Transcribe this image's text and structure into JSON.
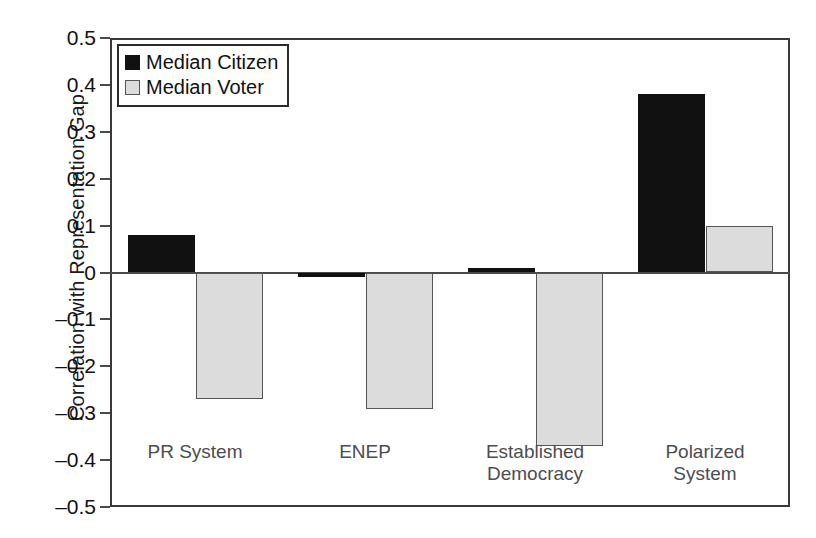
{
  "chart_data": {
    "type": "bar",
    "title": "",
    "xlabel": "",
    "ylabel": "Correlation with Representation Gap",
    "ylim": [
      -0.5,
      0.5
    ],
    "ytick_labels": [
      "0.5",
      "0.4",
      "0.3",
      "0.2",
      "0.1",
      "0",
      "–0.1",
      "–0.2",
      "–0.3",
      "–0.4",
      "–0.5"
    ],
    "ytick_values": [
      0.5,
      0.4,
      0.3,
      0.2,
      0.1,
      0,
      -0.1,
      -0.2,
      -0.3,
      -0.4,
      -0.5
    ],
    "grid": false,
    "legend_position": "top-left",
    "categories": [
      "PR System",
      "ENEP",
      "Established\nDemocracy",
      "Polarized\nSystem"
    ],
    "series": [
      {
        "name": "Median Citizen",
        "color": "#111111",
        "values": [
          0.08,
          -0.01,
          0.01,
          0.38
        ]
      },
      {
        "name": "Median Voter",
        "color": "#dcdcdc",
        "values": [
          -0.27,
          -0.29,
          -0.37,
          0.1
        ]
      }
    ]
  },
  "legend": {
    "items": [
      {
        "label": "Median Citizen",
        "swatch": "citizen"
      },
      {
        "label": "Median Voter",
        "swatch": "voter"
      }
    ]
  }
}
